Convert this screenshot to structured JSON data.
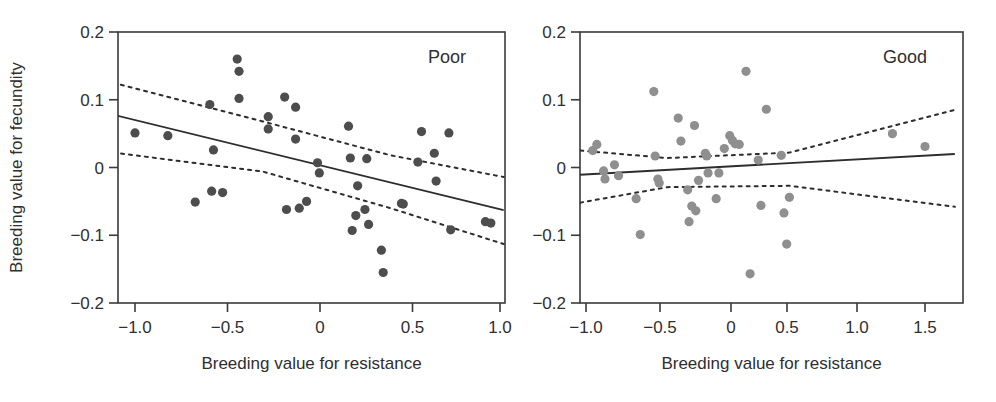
{
  "figure": {
    "background": "#ffffff",
    "panel_count": 2
  },
  "chart_data": [
    {
      "type": "scatter",
      "title": "Poor",
      "xlabel": "Breeding value for resistance",
      "ylabel": "Breeding value for fecundity",
      "xlim": [
        -1.12,
        1.04
      ],
      "ylim": [
        -0.2,
        0.2
      ],
      "grid": false,
      "legend": "none",
      "point_color": "#4d4d4d",
      "xticks": [
        -1.0,
        -0.5,
        0,
        0.5,
        1.0
      ],
      "xticklabels": [
        "−1.0",
        "−0.5",
        "0",
        "0.5",
        "1.0"
      ],
      "yticks": [
        0.2,
        0.1,
        0,
        -0.1,
        -0.2
      ],
      "yticklabels": [
        "0.2",
        "0.1",
        "0",
        "−0.1",
        "−0.2"
      ],
      "points": [
        [
          -1.0,
          0.051
        ],
        [
          -0.82,
          0.047
        ],
        [
          -0.67,
          -0.051
        ],
        [
          -0.59,
          0.093
        ],
        [
          -0.58,
          -0.035
        ],
        [
          -0.57,
          0.026
        ],
        [
          -0.52,
          -0.037
        ],
        [
          -0.44,
          0.16
        ],
        [
          -0.43,
          0.142
        ],
        [
          -0.43,
          0.102
        ],
        [
          -0.27,
          0.075
        ],
        [
          -0.27,
          0.057
        ],
        [
          -0.18,
          0.104
        ],
        [
          -0.17,
          -0.062
        ],
        [
          -0.12,
          0.089
        ],
        [
          -0.12,
          0.042
        ],
        [
          -0.1,
          -0.06
        ],
        [
          -0.06,
          -0.05
        ],
        [
          0.0,
          0.007
        ],
        [
          0.01,
          -0.008
        ],
        [
          0.17,
          0.061
        ],
        [
          0.18,
          0.014
        ],
        [
          0.19,
          -0.093
        ],
        [
          0.21,
          -0.071
        ],
        [
          0.22,
          -0.027
        ],
        [
          0.26,
          -0.062
        ],
        [
          0.27,
          0.013
        ],
        [
          0.28,
          -0.084
        ],
        [
          0.35,
          -0.122
        ],
        [
          0.36,
          -0.155
        ],
        [
          0.46,
          -0.053
        ],
        [
          0.47,
          -0.054
        ],
        [
          0.55,
          0.008
        ],
        [
          0.57,
          0.053
        ],
        [
          0.64,
          0.021
        ],
        [
          0.65,
          -0.02
        ],
        [
          0.72,
          0.051
        ],
        [
          0.73,
          -0.092
        ],
        [
          0.92,
          -0.08
        ],
        [
          0.95,
          -0.082
        ]
      ],
      "fit_line": {
        "x": [
          -1.12,
          1.02
        ],
        "y": [
          0.078,
          -0.063
        ],
        "style": "solid"
      },
      "ci_upper": {
        "x": [
          -1.12,
          -0.3,
          0.4,
          1.02
        ],
        "y": [
          0.125,
          0.068,
          0.018,
          -0.014
        ],
        "style": "dashed"
      },
      "ci_lower": {
        "x": [
          -1.12,
          -0.3,
          0.4,
          1.02
        ],
        "y": [
          0.022,
          -0.006,
          -0.06,
          -0.113
        ],
        "style": "dashed"
      }
    },
    {
      "type": "scatter",
      "title": "Good",
      "xlabel": "Breeding value for resistance",
      "ylabel": "",
      "xlim": [
        -1.16,
        1.73
      ],
      "ylim": [
        -0.2,
        0.2
      ],
      "grid": false,
      "legend": "none",
      "point_color": "#8f8f8f",
      "xticks": [
        -1.0,
        -0.5,
        0,
        0.5,
        1.0,
        1.5
      ],
      "xticklabels": [
        "−1.0",
        "−0.5",
        "0",
        "0.5",
        "1.0",
        "1.5"
      ],
      "yticks": [
        0.2,
        0.1,
        0,
        -0.1,
        -0.2
      ],
      "yticklabels": [
        "0.2",
        "0.1",
        "0",
        "−0.1",
        "−0.2"
      ],
      "points": [
        [
          -0.95,
          0.025
        ],
        [
          -0.92,
          0.034
        ],
        [
          -0.87,
          -0.005
        ],
        [
          -0.86,
          -0.017
        ],
        [
          -0.79,
          0.004
        ],
        [
          -0.76,
          -0.012
        ],
        [
          -0.63,
          -0.046
        ],
        [
          -0.6,
          -0.099
        ],
        [
          -0.5,
          0.112
        ],
        [
          -0.49,
          0.017
        ],
        [
          -0.47,
          -0.017
        ],
        [
          -0.46,
          -0.023
        ],
        [
          -0.32,
          0.073
        ],
        [
          -0.3,
          0.039
        ],
        [
          -0.25,
          -0.033
        ],
        [
          -0.24,
          -0.08
        ],
        [
          -0.22,
          -0.057
        ],
        [
          -0.2,
          0.062
        ],
        [
          -0.19,
          -0.064
        ],
        [
          -0.17,
          -0.019
        ],
        [
          -0.12,
          0.021
        ],
        [
          -0.11,
          0.017
        ],
        [
          -0.1,
          -0.008
        ],
        [
          -0.04,
          -0.046
        ],
        [
          -0.02,
          -0.008
        ],
        [
          0.02,
          0.028
        ],
        [
          0.06,
          0.047
        ],
        [
          0.08,
          0.04
        ],
        [
          0.1,
          0.035
        ],
        [
          0.13,
          0.034
        ],
        [
          0.18,
          0.142
        ],
        [
          0.21,
          -0.157
        ],
        [
          0.27,
          0.011
        ],
        [
          0.29,
          -0.056
        ],
        [
          0.33,
          0.086
        ],
        [
          0.44,
          0.018
        ],
        [
          0.46,
          -0.067
        ],
        [
          0.48,
          -0.113
        ],
        [
          0.5,
          -0.044
        ],
        [
          1.26,
          0.05
        ],
        [
          1.5,
          0.031
        ]
      ],
      "fit_line": {
        "x": [
          -1.16,
          1.72
        ],
        "y": [
          -0.012,
          0.02
        ],
        "style": "solid"
      },
      "ci_upper": {
        "x": [
          -1.16,
          -0.4,
          0.5,
          1.72
        ],
        "y": [
          0.027,
          0.014,
          0.022,
          0.085
        ],
        "style": "dashed"
      },
      "ci_lower": {
        "x": [
          -1.16,
          -0.4,
          0.5,
          1.72
        ],
        "y": [
          -0.056,
          -0.029,
          -0.027,
          -0.058
        ],
        "style": "dashed"
      }
    }
  ],
  "panels": {
    "left": {
      "label": "Poor",
      "xlabel": "Breeding value for resistance",
      "ylabel": "Breeding value for fecundity",
      "xticklabels": [
        "−1.0",
        "−0.5",
        "0",
        "0.5",
        "1.0"
      ],
      "yticklabels": [
        "0.2",
        "0.1",
        "0",
        "−0.1",
        "−0.2"
      ]
    },
    "right": {
      "label": "Good",
      "xlabel": "Breeding value for resistance",
      "xticklabels": [
        "−1.0",
        "−0.5",
        "0",
        "0.5",
        "1.0",
        "1.5"
      ],
      "yticklabels": [
        "0.2",
        "0.1",
        "0",
        "−0.1",
        "−0.2"
      ]
    }
  }
}
